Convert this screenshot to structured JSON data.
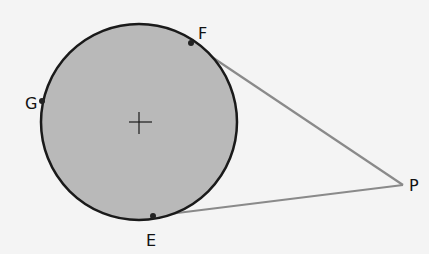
{
  "diagram": {
    "type": "circle with two tangent segments from external point",
    "circle": {
      "cx": 139,
      "cy": 122,
      "r": 98,
      "fill": "#b9b9b9",
      "stroke": "#1a1a1a"
    },
    "center_mark": "+",
    "points": [
      {
        "name": "F",
        "x": 191,
        "y": 43,
        "label": "F",
        "lx": 198,
        "ly": 39
      },
      {
        "name": "G",
        "x": 42,
        "y": 101,
        "label": "G",
        "lx": 25,
        "ly": 109
      },
      {
        "name": "E",
        "x": 153,
        "y": 216,
        "label": "E",
        "lx": 146,
        "ly": 246
      },
      {
        "name": "P",
        "x": 403,
        "y": 185,
        "label": "P",
        "lx": 409,
        "ly": 191
      }
    ],
    "segments": [
      {
        "from": "F",
        "to": "P",
        "color": "#8a8a8a"
      },
      {
        "from": "E",
        "to": "P",
        "color": "#8a8a8a"
      }
    ]
  }
}
